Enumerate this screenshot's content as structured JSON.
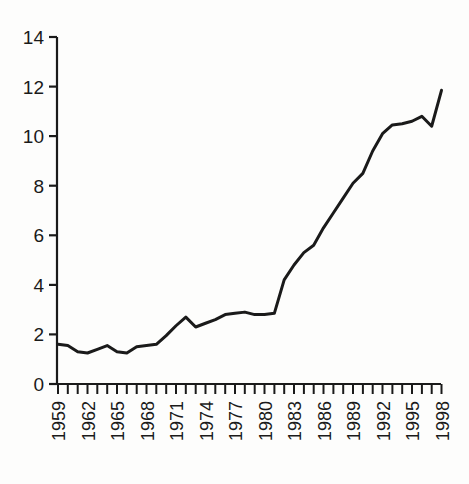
{
  "chart_data": {
    "type": "line",
    "title": "",
    "subtitle": "",
    "xlabel": "",
    "ylabel": "",
    "xlim": [
      1959,
      1998
    ],
    "ylim": [
      0,
      14
    ],
    "yticks": [
      0,
      2,
      4,
      6,
      8,
      10,
      12,
      14
    ],
    "ytick_labels": [
      "0",
      "2",
      "4",
      "6",
      "8",
      "10",
      "12",
      "14"
    ],
    "xticks": [
      1959,
      1962,
      1965,
      1968,
      1971,
      1974,
      1977,
      1980,
      1983,
      1986,
      1989,
      1992,
      1995,
      1998
    ],
    "xtick_labels": [
      "1959",
      "1962",
      "1965",
      "1968",
      "1971",
      "1974",
      "1977",
      "1980",
      "1983",
      "1986",
      "1989",
      "1992",
      "1995",
      "1998"
    ],
    "xtick_label_rotation": -90,
    "minor_xticks_every": 1,
    "grid": false,
    "legend": null,
    "legend_position": "none",
    "axis_style": "left-and-bottom-spines",
    "line_color": "#1a1a1a",
    "line_width": 3,
    "x": [
      1959,
      1960,
      1961,
      1962,
      1963,
      1964,
      1965,
      1966,
      1967,
      1968,
      1969,
      1970,
      1971,
      1972,
      1973,
      1974,
      1975,
      1976,
      1977,
      1978,
      1979,
      1980,
      1981,
      1982,
      1983,
      1984,
      1985,
      1986,
      1987,
      1988,
      1989,
      1990,
      1991,
      1992,
      1993,
      1994,
      1995,
      1996,
      1997,
      1998
    ],
    "values": [
      1.6,
      1.55,
      1.3,
      1.25,
      1.4,
      1.55,
      1.3,
      1.25,
      1.5,
      1.55,
      1.6,
      1.9,
      2.35,
      2.7,
      2.35,
      2.5,
      2.65,
      2.8,
      2.85,
      2.9,
      2.8,
      2.8,
      2.85,
      3.6,
      4.2,
      4.8,
      5.3,
      5.6,
      6.3,
      6.9,
      7.5,
      8.1,
      8.5,
      9.4,
      10.1,
      10.45,
      10.5,
      10.6,
      10.8,
      10.4
    ],
    "series": [
      {
        "name": "series-1",
        "points": [
          {
            "x": 1959,
            "y": 1.6
          },
          {
            "x": 1960,
            "y": 1.55
          },
          {
            "x": 1961,
            "y": 1.3
          },
          {
            "x": 1962,
            "y": 1.25
          },
          {
            "x": 1963,
            "y": 1.4
          },
          {
            "x": 1964,
            "y": 1.55
          },
          {
            "x": 1965,
            "y": 1.3
          },
          {
            "x": 1966,
            "y": 1.25
          },
          {
            "x": 1967,
            "y": 1.5
          },
          {
            "x": 1968,
            "y": 1.55
          },
          {
            "x": 1969,
            "y": 1.6
          },
          {
            "x": 1970,
            "y": 1.95
          },
          {
            "x": 1971,
            "y": 2.35
          },
          {
            "x": 1972,
            "y": 2.7
          },
          {
            "x": 1973,
            "y": 2.3
          },
          {
            "x": 1974,
            "y": 2.45
          },
          {
            "x": 1975,
            "y": 2.6
          },
          {
            "x": 1976,
            "y": 2.8
          },
          {
            "x": 1977,
            "y": 2.85
          },
          {
            "x": 1978,
            "y": 2.9
          },
          {
            "x": 1979,
            "y": 2.8
          },
          {
            "x": 1980,
            "y": 2.8
          },
          {
            "x": 1981,
            "y": 2.85
          },
          {
            "x": 1982,
            "y": 4.2
          },
          {
            "x": 1983,
            "y": 4.8
          },
          {
            "x": 1984,
            "y": 5.3
          },
          {
            "x": 1985,
            "y": 5.6
          },
          {
            "x": 1986,
            "y": 6.3
          },
          {
            "x": 1987,
            "y": 6.9
          },
          {
            "x": 1988,
            "y": 7.5
          },
          {
            "x": 1989,
            "y": 8.1
          },
          {
            "x": 1990,
            "y": 8.5
          },
          {
            "x": 1991,
            "y": 9.4
          },
          {
            "x": 1992,
            "y": 10.1
          },
          {
            "x": 1993,
            "y": 10.45
          },
          {
            "x": 1994,
            "y": 10.5
          },
          {
            "x": 1995,
            "y": 10.6
          },
          {
            "x": 1996,
            "y": 10.8
          },
          {
            "x": 1997,
            "y": 10.4
          },
          {
            "x": 1998,
            "y": 11.85
          }
        ]
      }
    ],
    "curve_pixel_path": "M 58,364 L 66,366 L 75,373 L 84,375 L 93,370 L 101,366 L 110,373 L 119,375 L 128,368 L 137,366 L 146,364 L 155,355 L 163,345 L 172,334 L 181,345 L 190,341 L 199,337 L 208,331 L 217,330 L 226,328 L 235,331 L 244,331 L 253,330 L 262,291 L 271,275 L 280,262 L 289,254 L 298,235 L 307,219 L 316,203 L 324,187 L 333,177 L 342,152 L 351,134 L 360,125 L 369,123 L 378,120 L 387,115 L 396,126 L 405,79"
  },
  "axes": {
    "y_axis_name": "y-axis",
    "x_axis_name": "x-axis"
  }
}
